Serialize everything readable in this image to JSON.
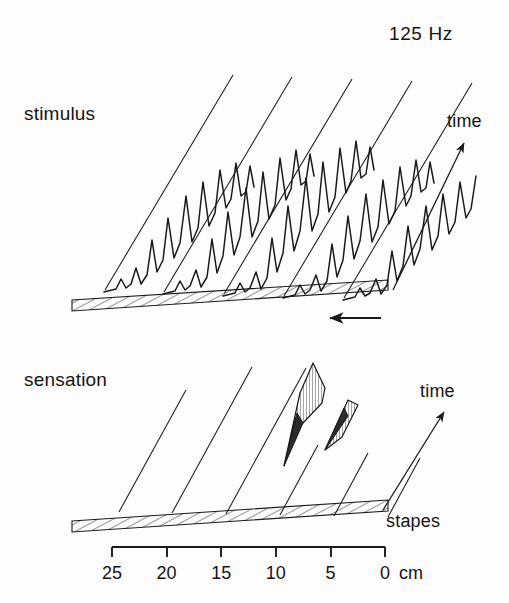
{
  "figure": {
    "title": "125 Hz",
    "panels": [
      {
        "key": "stimulus",
        "label": "stimulus",
        "time_label": "time"
      },
      {
        "key": "sensation",
        "label": "sensation",
        "time_label": "time"
      }
    ],
    "stapes_label": "stapes",
    "unit_label": "cm",
    "line_color": "#1a1a1a",
    "background_color": "#fdfdfd",
    "hatch_color": "#2a2a2a",
    "shade_color": "#8e8e8e"
  },
  "axis": {
    "orientation": "horizontal",
    "direction": "right-to-left",
    "tick_labels": [
      "25",
      "20",
      "15",
      "10",
      "5",
      "0"
    ],
    "tick_values": [
      25,
      20,
      15,
      10,
      5,
      0
    ],
    "unit": "cm",
    "range": [
      0,
      25
    ],
    "x_start_px": 112,
    "x_end_px": 385,
    "y_px": 547
  },
  "chart_data": {
    "type": "line",
    "title": "125 Hz",
    "subtitle": "",
    "xlabel": "distance from stapes (cm)",
    "ylabel": "amplitude",
    "zlabel": "time",
    "xlim": [
      0,
      25
    ],
    "grid": false,
    "legend": "none",
    "annotations": [
      {
        "text": "125 Hz",
        "role": "stimulus-frequency"
      },
      {
        "text": "stimulus",
        "role": "panel-label-upper"
      },
      {
        "text": "sensation",
        "role": "panel-label-lower"
      },
      {
        "text": "time",
        "role": "axis-arrow-upper"
      },
      {
        "text": "time",
        "role": "axis-arrow-lower"
      },
      {
        "text": "stapes",
        "role": "origin-marker"
      },
      {
        "text": "0 cm",
        "role": "axis-origin"
      }
    ],
    "panels": [
      {
        "name": "stimulus",
        "description": "Five successive snapshots in time of the basilar-membrane traveling wave for a 125 Hz tone; each trace runs along the cochlear-distance axis and oscillates with an envelope peaking near 10 cm.",
        "traces": 5,
        "series": [
          {
            "name": "t1",
            "envelope_peak_cm": 9.5,
            "peak_amplitude": 0.78
          },
          {
            "name": "t2",
            "envelope_peak_cm": 9.5,
            "peak_amplitude": 0.95
          },
          {
            "name": "t3",
            "envelope_peak_cm": 9.5,
            "peak_amplitude": 1.0
          },
          {
            "name": "t4",
            "envelope_peak_cm": 9.5,
            "peak_amplitude": 0.88
          },
          {
            "name": "t5",
            "envelope_peak_cm": 9.5,
            "peak_amplitude": 0.72
          }
        ]
      },
      {
        "name": "sensation",
        "description": "Corresponding sensation magnitude: two narrow shaded excitation bands appear near 9 and 6 cm; other time slices show no sensation.",
        "traces": 6,
        "series": [
          {
            "name": "t1",
            "excitation_cm": null,
            "peak_amplitude": 0.0
          },
          {
            "name": "t2",
            "excitation_cm": null,
            "peak_amplitude": 0.0
          },
          {
            "name": "t3",
            "excitation_cm": null,
            "peak_amplitude": 0.0
          },
          {
            "name": "t4",
            "excitation_cm": 9.0,
            "peak_amplitude": 1.0
          },
          {
            "name": "t5",
            "excitation_cm": 6.0,
            "peak_amplitude": 0.62
          },
          {
            "name": "t6",
            "excitation_cm": null,
            "peak_amplitude": 0.0
          }
        ]
      }
    ],
    "flow_arrow": {
      "direction": "leftward",
      "meaning": "wave travel direction from stapes toward apex"
    }
  }
}
